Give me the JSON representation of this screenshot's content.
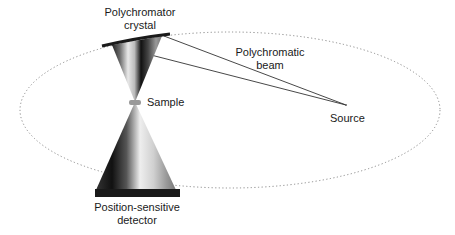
{
  "diagram": {
    "type": "x-ray polychromator geometry",
    "labels": {
      "crystal_line1": "Polychromator",
      "crystal_line2": "crystal",
      "beam_line1": "Polychromatic",
      "beam_line2": "beam",
      "sample": "Sample",
      "source": "Source",
      "detector_line1": "Position-sensitive",
      "detector_line2": "detector"
    },
    "colors": {
      "ink": "#1a1a1a",
      "ellipse": "#8a8a8a",
      "sample": "#9a9a9a"
    }
  }
}
